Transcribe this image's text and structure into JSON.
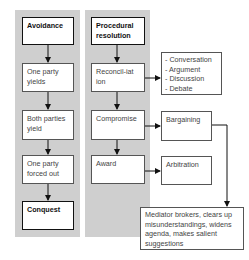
{
  "diagram": {
    "avoidance_column": {
      "header": "Avoidance",
      "steps": [
        "One party yields",
        "Both parties yield",
        "One party forced out"
      ],
      "outcome": "Conquest"
    },
    "procedural_column": {
      "header": "Procedural resolution",
      "steps": [
        "Reconcil-iation",
        "Compromise",
        "Award"
      ]
    },
    "reconciliation_forms": [
      "- Conversation",
      "- Argument",
      "- Discussion",
      "- Debate"
    ],
    "compromise_form": "Bargaining",
    "award_form": "Arbitration",
    "mediator_note": "Mediator brokers, clears up misunderstandings, widens agenda, makes salient suggestions"
  }
}
